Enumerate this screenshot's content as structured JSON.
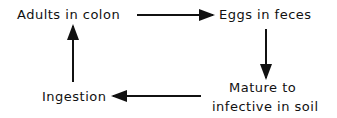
{
  "diagram": {
    "title": "",
    "nodes": [
      {
        "id": "adults",
        "label": "Adults in colon"
      },
      {
        "id": "eggs",
        "label": "Eggs in feces"
      },
      {
        "id": "mature",
        "label_line1": "Mature to",
        "label_line2": "infective in soil"
      },
      {
        "id": "ingestion",
        "label": "Ingestion"
      }
    ],
    "edges": [
      {
        "from": "adults",
        "to": "eggs"
      },
      {
        "from": "eggs",
        "to": "mature"
      },
      {
        "from": "mature",
        "to": "ingestion"
      },
      {
        "from": "ingestion",
        "to": "adults"
      }
    ]
  }
}
